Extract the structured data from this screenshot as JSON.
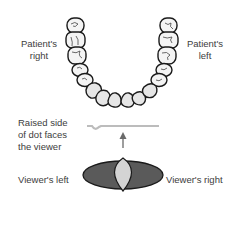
{
  "labels": {
    "patient_right": [
      "Patient's",
      "right"
    ],
    "patient_left": [
      "Patient's",
      "left"
    ],
    "raised_side": [
      "Raised side",
      "of dot faces",
      "the viewer"
    ],
    "viewer_left": "Viewer's left",
    "viewer_right": "Viewer's right"
  },
  "colors": {
    "tooth_fill": "#e4e4e4",
    "tooth_stroke": "#1a1a1a",
    "film_dark": "#5a5a5a",
    "film_light": "#d4d4d4",
    "dot_line": "#bcbcbc",
    "arrow": "#6a6a6a"
  }
}
